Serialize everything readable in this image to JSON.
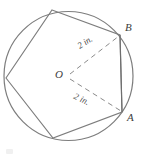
{
  "figure": {
    "kind": "geometry-diagram",
    "colors": {
      "stroke": "#7a7a7a",
      "dashed_stroke": "#8a8a8a",
      "label_text": "#3d3d3d",
      "background": "#ffffff"
    },
    "circle": {
      "center_label": "O",
      "center_x": 68.5,
      "center_y": 76,
      "radius": 65
    },
    "vertices": [
      {
        "name": "B",
        "label": "B",
        "x": 120,
        "y": 35
      },
      {
        "name": "A",
        "label": "A",
        "x": 122,
        "y": 112
      },
      {
        "name": "bottom",
        "label": "",
        "x": 53,
        "y": 138
      },
      {
        "name": "left",
        "label": "",
        "x": 6,
        "y": 78
      },
      {
        "name": "top",
        "label": "",
        "x": 52,
        "y": 10
      }
    ],
    "radii": [
      {
        "from": "O",
        "to": "B",
        "length_label": "2 in.",
        "style": "dashed"
      },
      {
        "from": "O",
        "to": "A",
        "length_label": "2 in.",
        "style": "dashed"
      }
    ],
    "chord": {
      "from": "A",
      "to": "B",
      "style": "solid"
    }
  }
}
